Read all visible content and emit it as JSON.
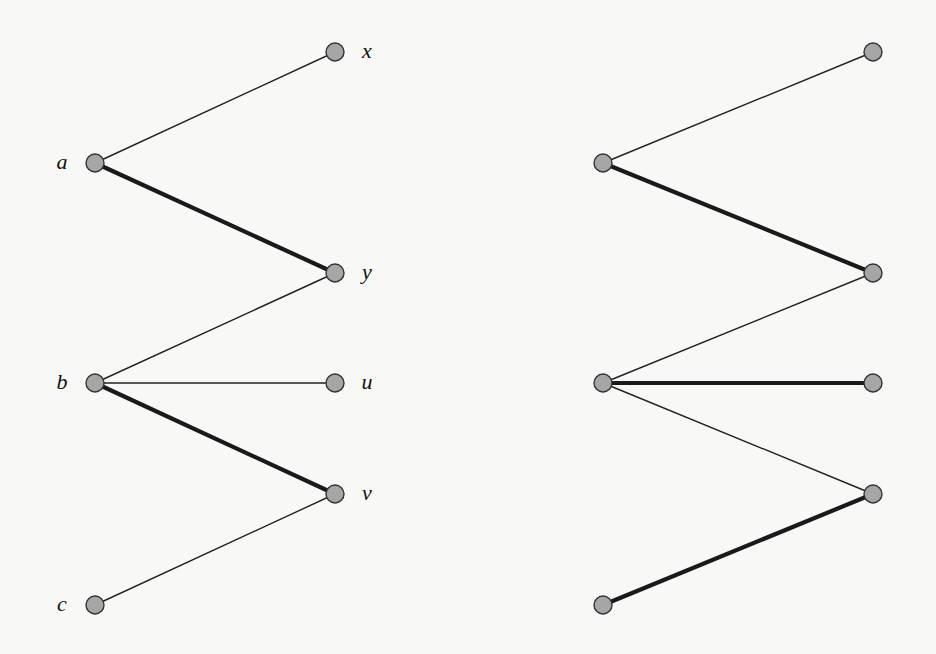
{
  "figure": {
    "node_radius": 9,
    "colors": {
      "node_fill": "#a6a6a6",
      "node_stroke": "#333333",
      "edge": "#222222",
      "background": "#f8f8f6"
    }
  },
  "graphs": [
    {
      "id": "left",
      "nodes": [
        {
          "id": "a",
          "label": "a",
          "x": 95,
          "y": 163,
          "label_side": "left"
        },
        {
          "id": "b",
          "label": "b",
          "x": 95,
          "y": 383,
          "label_side": "left"
        },
        {
          "id": "c",
          "label": "c",
          "x": 95,
          "y": 605,
          "label_side": "left"
        },
        {
          "id": "x",
          "label": "x",
          "x": 335,
          "y": 52,
          "label_side": "right"
        },
        {
          "id": "y",
          "label": "y",
          "x": 335,
          "y": 273,
          "label_side": "right"
        },
        {
          "id": "u",
          "label": "u",
          "x": 335,
          "y": 383,
          "label_side": "right"
        },
        {
          "id": "v",
          "label": "v",
          "x": 335,
          "y": 494,
          "label_side": "right"
        }
      ],
      "edges": [
        {
          "from": "a",
          "to": "x",
          "matched": false
        },
        {
          "from": "a",
          "to": "y",
          "matched": true
        },
        {
          "from": "b",
          "to": "y",
          "matched": false
        },
        {
          "from": "b",
          "to": "u",
          "matched": false
        },
        {
          "from": "b",
          "to": "v",
          "matched": true
        },
        {
          "from": "c",
          "to": "v",
          "matched": false
        }
      ]
    },
    {
      "id": "right",
      "nodes": [
        {
          "id": "a",
          "label": "",
          "x": 603,
          "y": 163
        },
        {
          "id": "b",
          "label": "",
          "x": 603,
          "y": 383
        },
        {
          "id": "c",
          "label": "",
          "x": 603,
          "y": 605
        },
        {
          "id": "x",
          "label": "",
          "x": 873,
          "y": 52
        },
        {
          "id": "y",
          "label": "",
          "x": 873,
          "y": 273
        },
        {
          "id": "u",
          "label": "",
          "x": 873,
          "y": 383
        },
        {
          "id": "v",
          "label": "",
          "x": 873,
          "y": 494
        }
      ],
      "edges": [
        {
          "from": "a",
          "to": "x",
          "matched": false
        },
        {
          "from": "a",
          "to": "y",
          "matched": true
        },
        {
          "from": "b",
          "to": "y",
          "matched": false
        },
        {
          "from": "b",
          "to": "u",
          "matched": true
        },
        {
          "from": "b",
          "to": "v",
          "matched": false
        },
        {
          "from": "c",
          "to": "v",
          "matched": true
        }
      ]
    }
  ]
}
